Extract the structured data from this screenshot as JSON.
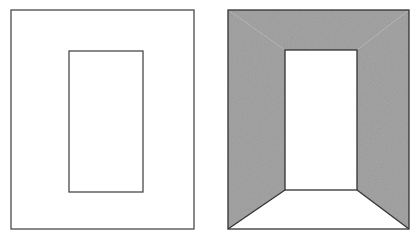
{
  "figure": {
    "kind": "line-drawing-illusion",
    "title": "",
    "background_color": "#ffffff",
    "width": 418,
    "height": 240,
    "panel_count": 2,
    "stroke_color": "#3a3a3a",
    "stroke_width": 1.2,
    "shade_color": "#9d9d9d",
    "shade_edge_color": "#2e2e2e",
    "white_fill": "#ffffff"
  },
  "panels": [
    {
      "id": "panel-left",
      "name": "flat-nested-rectangles",
      "label": "",
      "description": "Outline-only frame: a large rectangle containing a smaller concentric rectangle, no shading, ambiguous flat figure.",
      "outer_rect": {
        "x": 11,
        "y": 10,
        "width": 183,
        "height": 219,
        "fill": "#ffffff",
        "stroke": "#3a3a3a"
      },
      "inner_rect": {
        "x": 69,
        "y": 51,
        "width": 74,
        "height": 141,
        "fill": "#ffffff",
        "stroke": "#3a3a3a"
      },
      "shaded_regions": [],
      "diagonals": []
    },
    {
      "id": "panel-right",
      "name": "shaded-corridor-perspective",
      "label": "",
      "description": "Same nested rectangles with the frame shaded gray and diagonals from the inner lower corners to the outer lower corners, producing a corridor or doorway read in depth.",
      "outer_rect": {
        "x": 228,
        "y": 10,
        "width": 181,
        "height": 219,
        "fill": "#9d9d9d",
        "stroke": "#2e2e2e"
      },
      "inner_rect": {
        "x": 285,
        "y": 50,
        "width": 72,
        "height": 140,
        "fill": "#ffffff",
        "stroke": "#2e2e2e"
      },
      "shaded_regions": [
        {
          "name": "left-wall",
          "points": "228,10 285,50 285,190 228,229",
          "fill": "#9d9d9d"
        },
        {
          "name": "ceiling",
          "points": "228,10 409,10 357,50 285,50",
          "fill": "#9d9d9d"
        },
        {
          "name": "right-wall",
          "points": "409,10 409,229 357,190 357,50",
          "fill": "#9d9d9d"
        }
      ],
      "white_regions": [
        {
          "name": "back-wall",
          "points": "285,50 357,50 357,190 285,190",
          "fill": "#ffffff"
        },
        {
          "name": "floor",
          "points": "228,229 285,190 357,190 409,229",
          "fill": "#ffffff"
        }
      ],
      "diagonals": [
        {
          "name": "floor-left-edge",
          "x1": 228,
          "y1": 229,
          "x2": 285,
          "y2": 190
        },
        {
          "name": "floor-right-edge",
          "x1": 409,
          "y1": 229,
          "x2": 357,
          "y2": 190
        }
      ]
    }
  ],
  "annotations": {
    "left_caption": "",
    "right_caption": "",
    "figure_number": ""
  }
}
